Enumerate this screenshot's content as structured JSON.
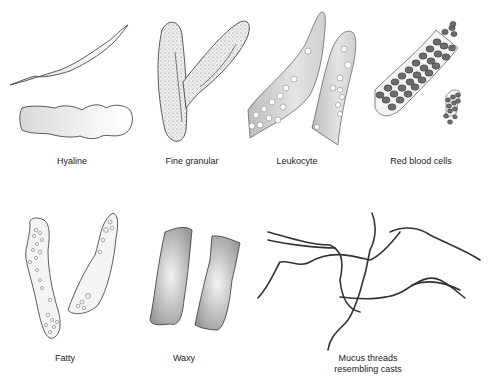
{
  "panels": [
    {
      "id": "hyaline",
      "label": "Hyaline"
    },
    {
      "id": "fine-granular",
      "label": "Fine granular"
    },
    {
      "id": "leukocyte",
      "label": "Leukocyte"
    },
    {
      "id": "red-blood-cells",
      "label": "Red blood cells"
    },
    {
      "id": "fatty",
      "label": "Fatty"
    },
    {
      "id": "waxy",
      "label": "Waxy"
    },
    {
      "id": "mucus-threads",
      "label_line1": "Mucus threads",
      "label_line2": "resembling casts"
    }
  ],
  "colors": {
    "outline": "#333333",
    "fill_light": "#e6e6e6",
    "fill_mid": "#c8c8c8",
    "fill_dark": "#8a8a8a",
    "rbc": "#6a6a6a"
  }
}
